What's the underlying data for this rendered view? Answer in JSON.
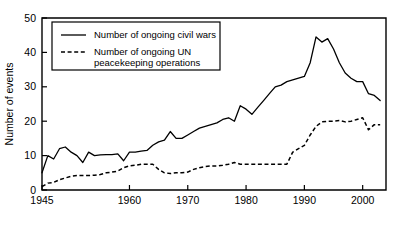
{
  "chart_data": {
    "type": "line",
    "title": "",
    "subtitle": "",
    "xlabel": "",
    "ylabel": "Number of events",
    "xlim": [
      1945,
      2004
    ],
    "ylim": [
      0,
      50
    ],
    "grid": false,
    "legend_position": "top-left",
    "xticks": [
      1945,
      1960,
      1970,
      1980,
      1990,
      2000
    ],
    "xtick_labels": [
      "1945",
      "1960",
      "1970",
      "1980",
      "1990",
      "2000"
    ],
    "yticks": [
      0,
      10,
      20,
      30,
      40,
      50
    ],
    "ytick_labels": [
      "0",
      "10",
      "20",
      "30",
      "40",
      "50"
    ],
    "x": [
      1945,
      1946,
      1947,
      1948,
      1949,
      1950,
      1951,
      1952,
      1953,
      1954,
      1955,
      1956,
      1957,
      1958,
      1959,
      1960,
      1961,
      1962,
      1963,
      1964,
      1965,
      1966,
      1967,
      1968,
      1969,
      1970,
      1971,
      1972,
      1973,
      1974,
      1975,
      1976,
      1977,
      1978,
      1979,
      1980,
      1981,
      1982,
      1983,
      1984,
      1985,
      1986,
      1987,
      1988,
      1989,
      1990,
      1991,
      1992,
      1993,
      1994,
      1995,
      1996,
      1997,
      1998,
      1999,
      2000,
      2001,
      2002,
      2003
    ],
    "series": [
      {
        "name": "Number of ongoing civil wars",
        "style": "solid",
        "color": "#000000",
        "values": [
          5,
          10,
          9,
          12,
          12.5,
          11,
          10,
          8,
          11,
          10,
          10.2,
          10.3,
          10.3,
          10.5,
          8.5,
          11,
          11,
          11.3,
          11.5,
          13,
          14,
          14.5,
          17,
          15,
          15,
          16,
          17,
          18,
          18.5,
          19,
          19.5,
          20.5,
          21,
          20,
          24.5,
          23.5,
          22,
          24,
          26,
          28,
          30,
          30.5,
          31.5,
          32,
          32.5,
          33,
          37,
          44.5,
          43,
          44,
          41,
          37,
          34,
          32.5,
          31.5,
          31.5,
          28,
          27.5,
          26
        ]
      },
      {
        "name": "Number of ongoing UN peacekeeping operations",
        "style": "dashed",
        "color": "#000000",
        "values": [
          1,
          2,
          2.2,
          3,
          3.5,
          4,
          4.2,
          4.2,
          4.2,
          4.3,
          4.5,
          5,
          5.2,
          5.5,
          6.5,
          7,
          7.2,
          7.5,
          7.5,
          7.5,
          6,
          5,
          4.8,
          5,
          5,
          5.2,
          6,
          6.5,
          6.8,
          7,
          7,
          7.2,
          7.5,
          8,
          7.5,
          7.5,
          7.5,
          7.5,
          7.5,
          7.5,
          7.5,
          7.5,
          7.5,
          11,
          12,
          13,
          16,
          18.5,
          19.8,
          20,
          20,
          20.2,
          19.8,
          20,
          20.5,
          21,
          17.5,
          19,
          19
        ]
      }
    ],
    "legend_entries": [
      {
        "label_line1": "Number of ongoing civil wars",
        "label_line2": "",
        "style": "solid"
      },
      {
        "label_line1": "Number of ongoing UN",
        "label_line2": "peacekeeping operations",
        "style": "dashed"
      }
    ]
  }
}
